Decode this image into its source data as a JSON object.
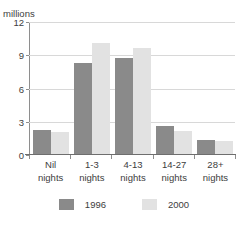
{
  "axis_unit_label": "millions",
  "title_partial": "",
  "chart_data": {
    "type": "bar",
    "title": "",
    "subtitle": "",
    "xlabel": "",
    "ylabel": "millions",
    "ylim": [
      0,
      12
    ],
    "yticks": [
      0,
      3,
      6,
      9,
      12
    ],
    "ytick_labels": [
      "0",
      "3",
      "6",
      "9",
      "12"
    ],
    "grid": true,
    "legend_position": "bottom",
    "categories": [
      "Nil nights",
      "1-3 nights",
      "4-13 nights",
      "14-27 nights",
      "28+ nights"
    ],
    "category_lines": [
      [
        "Nil",
        "nights"
      ],
      [
        "1-3",
        "nights"
      ],
      [
        "4-13",
        "nights"
      ],
      [
        "14-27",
        "nights"
      ],
      [
        "28+",
        "nights"
      ]
    ],
    "series": [
      {
        "name": "1996",
        "color": "#8a8a8a",
        "values": [
          2.2,
          8.2,
          8.7,
          2.5,
          1.3
        ]
      },
      {
        "name": "2000",
        "color": "#e2e2e2",
        "values": [
          2.0,
          10.0,
          9.6,
          2.1,
          1.2
        ]
      }
    ]
  }
}
